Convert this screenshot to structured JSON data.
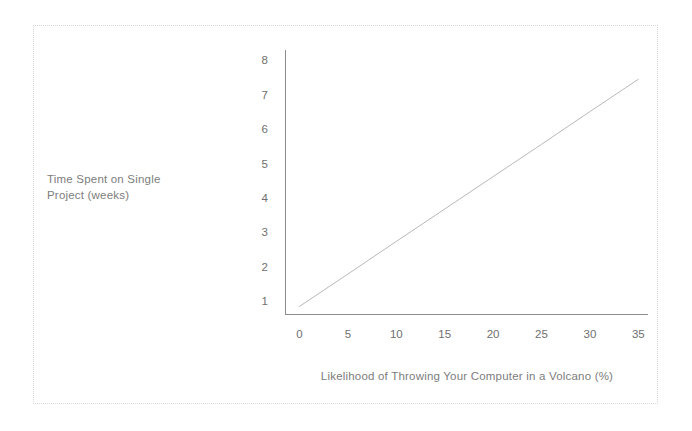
{
  "chart_data": {
    "type": "line",
    "title": "",
    "subtitle": "",
    "xlabel": "Likelihood of Throwing Your Computer in a Volcano (%)",
    "ylabel": "Time Spent on Single Project (weeks)",
    "ylabel_lines": [
      "Time Spent on Single",
      "Project (weeks)"
    ],
    "xlim": [
      -1.5,
      36
    ],
    "ylim": [
      0.6,
      8.3
    ],
    "xticks": [
      0,
      5,
      10,
      15,
      20,
      25,
      30,
      35
    ],
    "xtick_labels": [
      "0",
      "5",
      "10",
      "15",
      "20",
      "25",
      "30",
      "35"
    ],
    "yticks": [
      1,
      2,
      3,
      4,
      5,
      6,
      7,
      8
    ],
    "ytick_labels": [
      "1",
      "2",
      "3",
      "4",
      "5",
      "6",
      "7",
      "8"
    ],
    "grid": false,
    "legend": null,
    "series": [
      {
        "name": "Time Spent on Single Project",
        "color": "#b9b9b9",
        "line_width": 1,
        "x": [
          0,
          5,
          10,
          15,
          20,
          25,
          30,
          35
        ],
        "values": [
          0.85,
          1.79,
          2.74,
          3.68,
          4.62,
          5.56,
          6.51,
          7.45
        ]
      }
    ],
    "annotations": [],
    "colors": {
      "line": "#b9b9b9",
      "axis": "#8d8d8d",
      "tick_text": "#6f6f6f",
      "label_text": "#7d7d7d",
      "frame": "#d8d8d8",
      "background": "#ffffff"
    }
  }
}
